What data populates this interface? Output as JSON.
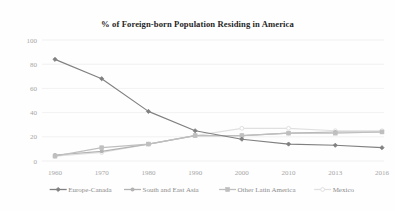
{
  "chart_data": {
    "type": "line",
    "title": "% of Foreign-born Population Residing in America",
    "xlabel": "",
    "ylabel": "",
    "categories": [
      "1960",
      "1970",
      "1980",
      "1990",
      "2000",
      "2010",
      "2013",
      "2016"
    ],
    "ylim": [
      0,
      100
    ],
    "yticks": [
      "0",
      "20",
      "40",
      "60",
      "80",
      "100"
    ],
    "grid": true,
    "legend_position": "bottom",
    "series": [
      {
        "name": "Europe-Canada",
        "color": "#808080",
        "marker": "filled-diamond",
        "values": [
          84,
          68,
          41,
          25,
          18,
          14,
          13,
          11
        ]
      },
      {
        "name": "South and East Asia",
        "color": "#b3b3b3",
        "marker": "filled-circle",
        "values": [
          5,
          8,
          14,
          21,
          21,
          23,
          24,
          24
        ]
      },
      {
        "name": "Other Latin America",
        "color": "#bfbfbf",
        "marker": "filled-square",
        "values": [
          4,
          11,
          14,
          21,
          21,
          23,
          23,
          24
        ]
      },
      {
        "name": "Mexico",
        "color": "#e0e0e0",
        "marker": "open-circle",
        "values": [
          4,
          7,
          14,
          21,
          27,
          27,
          25,
          25
        ]
      }
    ]
  },
  "legend": {
    "items": [
      {
        "label": "Europe-Canada"
      },
      {
        "label": "South and East Asia"
      },
      {
        "label": "Other Latin America"
      },
      {
        "label": "Mexico"
      }
    ]
  },
  "colors": {
    "background": "#fefefe",
    "grid": "#e8e8e8",
    "tick_label": "#a6a6a6",
    "title": "#262626",
    "legend_label": "#8c8c8c"
  }
}
